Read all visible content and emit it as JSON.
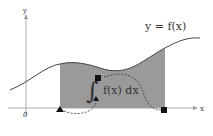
{
  "diagram": {
    "type": "definite-integral-illustration",
    "function_label": "y = f(x)",
    "integrand_label": "f(x) dx",
    "integral_sign": "∫",
    "axes": {
      "x_label": "x",
      "y_label": "y",
      "origin_label": "0"
    },
    "markers": {
      "lower_limit": "triangle",
      "upper_limit": "square"
    },
    "colors": {
      "shaded_area": "#9a9a9a",
      "curve": "#444444",
      "axes": "#999999",
      "markers": "#111111"
    }
  }
}
